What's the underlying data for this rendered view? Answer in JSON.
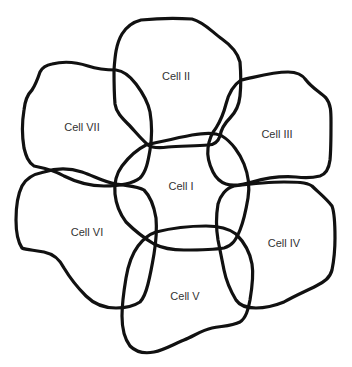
{
  "diagram": {
    "type": "overlapping-cell-outlines",
    "stroke_color": "#111111",
    "label_color": "#333333",
    "background": "#ffffff",
    "cells": [
      {
        "id": "I",
        "label": "Cell I",
        "label_x": 181,
        "label_y": 186
      },
      {
        "id": "II",
        "label": "Cell II",
        "label_x": 176,
        "label_y": 76
      },
      {
        "id": "III",
        "label": "Cell III",
        "label_x": 277,
        "label_y": 134
      },
      {
        "id": "IV",
        "label": "Cell IV",
        "label_x": 284,
        "label_y": 243
      },
      {
        "id": "V",
        "label": "Cell V",
        "label_x": 185,
        "label_y": 296
      },
      {
        "id": "VI",
        "label": "Cell VI",
        "label_x": 87,
        "label_y": 232
      },
      {
        "id": "VII",
        "label": "Cell VII",
        "label_x": 82,
        "label_y": 127
      }
    ]
  }
}
